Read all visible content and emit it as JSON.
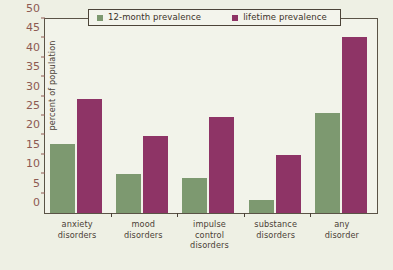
{
  "chart_data": {
    "type": "bar",
    "title": "",
    "subtitle": "",
    "xlabel": "",
    "ylabel": "percent of population",
    "ylim": [
      0,
      50
    ],
    "yticks": [
      0,
      5,
      10,
      15,
      20,
      25,
      30,
      35,
      40,
      45,
      50
    ],
    "grid": false,
    "legend_position": "top",
    "categories": [
      "anxiety disorders",
      "mood disorders",
      "impulse control disorders",
      "substance disorders",
      "any disorder"
    ],
    "category_lines": [
      [
        "anxiety",
        "disorders"
      ],
      [
        "mood",
        "disorders"
      ],
      [
        "impulse",
        "control",
        "disorders"
      ],
      [
        "substance",
        "disorders"
      ],
      [
        "any",
        "disorder"
      ]
    ],
    "series": [
      {
        "name": "12-month prevalence",
        "color": "#7d9970",
        "values": [
          18,
          10,
          9,
          3.5,
          26
        ]
      },
      {
        "name": "lifetime prevalence",
        "color": "#8e3466",
        "values": [
          29.5,
          20,
          25,
          15,
          45.5
        ]
      }
    ]
  },
  "legend": {
    "items": [
      {
        "label": "12-month prevalence",
        "swatch": "legend-swatch-green"
      },
      {
        "label": "lifetime prevalence",
        "swatch": "legend-swatch-purple"
      }
    ]
  },
  "colors": {
    "series_12_month": "#7d9970",
    "series_lifetime": "#8e3466",
    "plot_background": "#f2f3ea",
    "page_background": "#eef0e4",
    "axis_line": "#5a5346",
    "tick_label": "#8d5a52",
    "text": "#4b4136"
  }
}
